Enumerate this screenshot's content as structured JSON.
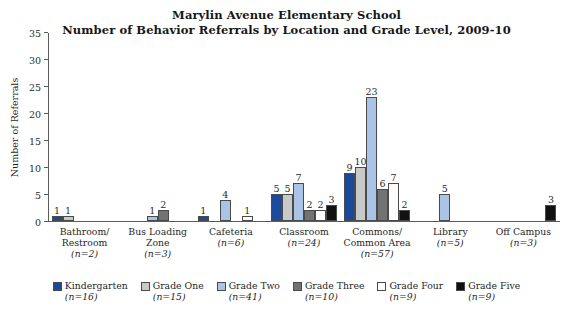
{
  "chart_data": {
    "type": "bar",
    "title": "Marylin Avenue Elementary School",
    "subtitle": "Number of Behavior Referrals by Location and Grade Level, 2009-10",
    "xlabel": "",
    "ylabel": "Number of Referrals",
    "ylim": [
      0,
      35
    ],
    "yticks": [
      0,
      5,
      10,
      15,
      20,
      25,
      30,
      35
    ],
    "grid": false,
    "legend_position": "bottom",
    "categories": [
      "Bathroom/ Restroom",
      "Bus Loading Zone",
      "Cafeteria",
      "Classroom",
      "Commons/ Common Area",
      "Library",
      "Off Campus"
    ],
    "category_lines": [
      [
        "Bathroom/",
        "Restroom"
      ],
      [
        "Bus Loading",
        "Zone"
      ],
      [
        "Cafeteria"
      ],
      [
        "Classroom"
      ],
      [
        "Commons/",
        "Common Area"
      ],
      [
        "Library"
      ],
      [
        "Off Campus"
      ]
    ],
    "category_counts": [
      "(n=2)",
      "(n=3)",
      "(n=6)",
      "(n=24)",
      "(n=57)",
      "(n=5)",
      "(n=3)"
    ],
    "series": [
      {
        "name": "Kindergarten",
        "count": "(n=16)",
        "color": "#1a4a9e",
        "values": [
          1,
          null,
          1,
          5,
          9,
          null,
          null
        ]
      },
      {
        "name": "Grade One",
        "count": "(n=15)",
        "color": "#c9c9c9",
        "values": [
          1,
          null,
          null,
          5,
          10,
          null,
          null
        ]
      },
      {
        "name": "Grade Two",
        "count": "(n=41)",
        "color": "#aac4e8",
        "values": [
          null,
          1,
          4,
          7,
          23,
          5,
          null
        ]
      },
      {
        "name": "Grade Three",
        "count": "(n=10)",
        "color": "#727272",
        "values": [
          null,
          2,
          null,
          2,
          6,
          null,
          null
        ]
      },
      {
        "name": "Grade Four",
        "count": "(n=9)",
        "color": "#fcfcfc",
        "values": [
          null,
          null,
          1,
          2,
          7,
          null,
          null
        ]
      },
      {
        "name": "Grade Five",
        "count": "(n=9)",
        "color": "#111111",
        "values": [
          null,
          null,
          null,
          3,
          2,
          null,
          3
        ]
      }
    ]
  }
}
